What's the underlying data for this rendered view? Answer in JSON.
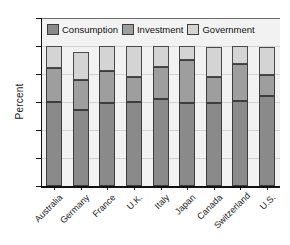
{
  "chart_data": {
    "type": "bar",
    "subtype": "stacked-bar",
    "title": "",
    "xlabel": "",
    "ylabel": "Percent",
    "ylim": [
      0,
      120
    ],
    "yticks": [
      0,
      20,
      40,
      60,
      80,
      100,
      120
    ],
    "ytick_labels": [
      "0",
      "20",
      "40",
      "60",
      "80",
      "100",
      "120"
    ],
    "grid": true,
    "grid_axis": "y",
    "legend_position": "top-inside",
    "categories": [
      "Australia",
      "Germany",
      "France",
      "U.K.",
      "Italy",
      "Japan",
      "Canada",
      "Switzerland",
      "U.S."
    ],
    "series": [
      {
        "name": "Consumption",
        "color": "#8a8a8a",
        "values": [
          60,
          54,
          59,
          60,
          62,
          59,
          59,
          61,
          64
        ]
      },
      {
        "name": "Investment",
        "color": "#9e9e9e",
        "values": [
          24,
          22,
          23,
          18,
          23,
          31,
          19,
          26,
          15
        ]
      },
      {
        "name": "Government",
        "color": "#d4d4d4",
        "values": [
          16,
          20,
          18,
          22,
          15,
          10,
          21,
          13,
          20
        ]
      }
    ],
    "cumulative_tops": [
      [
        60,
        84,
        100
      ],
      [
        54,
        76,
        96
      ],
      [
        59,
        82,
        100
      ],
      [
        60,
        78,
        100
      ],
      [
        62,
        85,
        100
      ],
      [
        59,
        90,
        100
      ],
      [
        59,
        78,
        99
      ],
      [
        61,
        87,
        100
      ],
      [
        64,
        79,
        99
      ]
    ],
    "totals": [
      100,
      96,
      100,
      100,
      100,
      100,
      99,
      100,
      99
    ]
  },
  "legend": {
    "items": [
      {
        "label": "Consumption",
        "color": "#8a8a8a"
      },
      {
        "label": "Investment",
        "color": "#9e9e9e"
      },
      {
        "label": "Government",
        "color": "#d4d4d4"
      }
    ]
  },
  "axes": {
    "y_title": "Percent"
  }
}
